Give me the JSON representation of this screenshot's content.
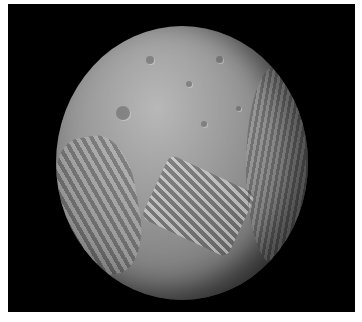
{
  "image": {
    "subject": "moon",
    "alt": "Grayscale photograph of a heavily cratered moon with patchwork grooved terrain against a black background",
    "colors": {
      "background": "#000000",
      "border": "#ffffff",
      "surface": "#9a9a9a"
    }
  }
}
